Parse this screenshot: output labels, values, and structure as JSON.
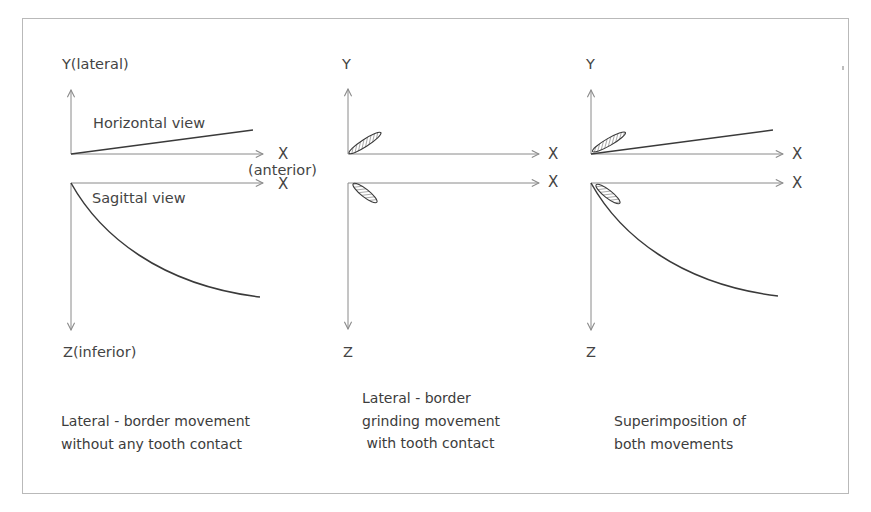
{
  "figure": {
    "panels": [
      {
        "id": "without-contact",
        "y_label": "Y(lateral)",
        "x_label_top": "X",
        "x_sublabel": "(anterior)",
        "x_label_bottom": "X",
        "z_label": "Z(inferior)",
        "horizontal_view_label": "Horizontal view",
        "sagittal_view_label": "Sagittal view",
        "caption": [
          "Lateral - border movement",
          "without any tooth contact"
        ]
      },
      {
        "id": "with-contact",
        "y_label": "Y",
        "x_label_top": "X",
        "x_label_bottom": "X",
        "z_label": "Z",
        "caption": [
          "Lateral - border",
          "grinding movement",
          " with tooth contact"
        ]
      },
      {
        "id": "superimposition",
        "y_label": "Y",
        "x_label_top": "X",
        "x_label_bottom": "X",
        "z_label": "Z",
        "caption": [
          "Superimposition of",
          "both movements"
        ]
      }
    ],
    "colors": {
      "axis": "#8a8a8a",
      "trace": "#3a3a3a",
      "frame": "#b9b9b9",
      "text": "#444444"
    }
  }
}
